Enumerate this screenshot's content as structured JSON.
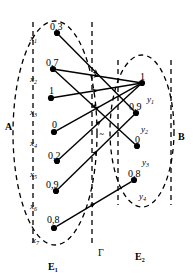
{
  "diagram": {
    "sets": {
      "left_set_label": "A",
      "right_set_label": "B",
      "left_region_label": "E",
      "left_region_sub": "1",
      "right_region_label": "E",
      "right_region_sub": "2",
      "relation_label": "Γ"
    },
    "colors": {
      "stroke": "#000000",
      "background": "#ffffff",
      "dash": "#000000"
    },
    "left_nodes": [
      {
        "id": "x1",
        "name": "x",
        "sub": "1",
        "value": "0,3",
        "cx": 57,
        "cy": 33,
        "label_x": 30,
        "label_y": 34,
        "value_x": 50,
        "value_y": 22
      },
      {
        "id": "x2",
        "name": "x",
        "sub": "2",
        "value": "0,7",
        "cx": 53,
        "cy": 69,
        "label_x": 30,
        "label_y": 75,
        "value_x": 46,
        "value_y": 58
      },
      {
        "id": "x3",
        "name": "x",
        "sub": "3",
        "value": "1",
        "cx": 51,
        "cy": 98,
        "label_x": 30,
        "label_y": 108,
        "value_x": 49,
        "value_y": 86
      },
      {
        "id": "x4",
        "name": "x",
        "sub": "4",
        "value": "0",
        "cx": 54,
        "cy": 132,
        "label_x": 30,
        "label_y": 139,
        "value_x": 52,
        "value_y": 120
      },
      {
        "id": "x5",
        "name": "x",
        "sub": "5",
        "value": "0,2",
        "cx": 57,
        "cy": 161,
        "label_x": 30,
        "label_y": 170,
        "value_x": 48,
        "value_y": 151
      },
      {
        "id": "x6",
        "name": "x",
        "sub": "6",
        "value": "0,9",
        "cx": 56,
        "cy": 191,
        "label_x": 30,
        "label_y": 202,
        "value_x": 46,
        "value_y": 180
      },
      {
        "id": "x7",
        "name": "x",
        "sub": "7",
        "value": "0,8",
        "cx": 54,
        "cy": 228,
        "label_x": 32,
        "label_y": 236,
        "value_x": 47,
        "value_y": 215
      }
    ],
    "right_nodes": [
      {
        "id": "y1",
        "name": "y",
        "sub": "1",
        "value": "1",
        "cx": 142,
        "cy": 83,
        "label_x": 147,
        "label_y": 95,
        "value_x": 140,
        "value_y": 72
      },
      {
        "id": "y2",
        "name": "y",
        "sub": "2",
        "value": "0,9",
        "cx": 136,
        "cy": 113,
        "label_x": 141,
        "label_y": 125,
        "value_x": 129,
        "value_y": 102
      },
      {
        "id": "y3",
        "name": "y",
        "sub": "3",
        "value": "0",
        "cx": 137,
        "cy": 146,
        "label_x": 142,
        "label_y": 158,
        "value_x": 135,
        "value_y": 135
      },
      {
        "id": "y4",
        "name": "y",
        "sub": "4",
        "value": "0,8",
        "cx": 134,
        "cy": 180,
        "label_x": 139,
        "label_y": 192,
        "value_x": 128,
        "value_y": 169
      }
    ],
    "edges": [
      {
        "from": "x1",
        "to": "y2"
      },
      {
        "from": "x2",
        "to": "y1"
      },
      {
        "from": "x2",
        "to": "y3"
      },
      {
        "from": "x3",
        "to": "y1"
      },
      {
        "from": "x4",
        "to": "y1"
      },
      {
        "from": "x5",
        "to": "y1"
      },
      {
        "from": "x6",
        "to": "y2"
      },
      {
        "from": "x7",
        "to": "y4"
      }
    ],
    "boundaries": {
      "left_ellipse": {
        "cx": 55,
        "cy": 133,
        "rx": 42,
        "ry": 112
      },
      "right_ellipse": {
        "cx": 142,
        "cy": 131,
        "rx": 32,
        "ry": 76
      },
      "left_vline_x": 33,
      "left_vline_y1": 22,
      "left_vline_y2": 244,
      "mid_vline_x": 92,
      "mid_vline_y1": 22,
      "mid_vline_y2": 244,
      "right_vline_x": 118,
      "right_vline_y1": 60,
      "right_vline_y2": 205,
      "right_vline2_x": 171,
      "right_vline2_y1": 60,
      "right_vline2_y2": 205
    },
    "annotations": {
      "A_x": 5,
      "A_y": 122,
      "B_x": 178,
      "B_y": 122,
      "E1_x": 48,
      "E1_y": 262,
      "E2_x": 135,
      "E2_y": 252,
      "gamma_x": 98,
      "gamma_y": 248
    }
  }
}
